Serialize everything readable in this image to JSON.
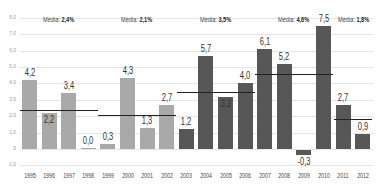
{
  "chart_data": {
    "type": "bar",
    "title": "",
    "xlabel": "",
    "ylabel": "",
    "ylim": [
      -1.0,
      8.0
    ],
    "yticks": [
      "8,0",
      "7,0",
      "6,0",
      "5,0",
      "4,0",
      "3,0",
      "2,0",
      "1,0",
      "0",
      "-1,0"
    ],
    "grid": true,
    "categories": [
      "1995",
      "1996",
      "1997",
      "1998",
      "1999",
      "2000",
      "2001",
      "2002",
      "2003",
      "2004",
      "2005",
      "2006",
      "2007",
      "2008",
      "2009",
      "2010",
      "2011",
      "2012"
    ],
    "values": [
      4.2,
      2.2,
      3.4,
      0.0,
      0.3,
      4.3,
      1.3,
      2.7,
      1.2,
      5.7,
      3.2,
      4.0,
      6.1,
      5.2,
      -0.3,
      7.5,
      2.7,
      0.9
    ],
    "value_labels": [
      "4,2",
      "2,2",
      "3,4",
      "0,0",
      "0,3",
      "4,3",
      "1,3",
      "2,7",
      "1,2",
      "5,7",
      "3,2",
      "4,0",
      "6,1",
      "5,2",
      "-0,3",
      "7,5",
      "2,7",
      "0,9"
    ],
    "bar_colors": {
      "1995-2002": "#a9a9a9",
      "2003-2012": "#575757"
    },
    "annotations": [
      {
        "label": "Média:",
        "value": "2,4%",
        "from": "1995",
        "to": "1998",
        "level": 2.4
      },
      {
        "label": "Média:",
        "value": "2,1%",
        "from": "1999",
        "to": "2002",
        "level": 2.1
      },
      {
        "label": "Média:",
        "value": "3,5%",
        "from": "2003",
        "to": "2006",
        "level": 3.5
      },
      {
        "label": "Média:",
        "value": "4,6%",
        "from": "2007",
        "to": "2010",
        "level": 4.6
      },
      {
        "label": "Média:",
        "value": "1,8%",
        "from": "2011",
        "to": "2012",
        "level": 1.8
      }
    ]
  }
}
